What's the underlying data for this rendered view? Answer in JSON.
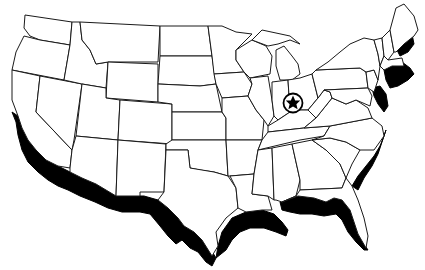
{
  "map": {
    "subject": "Outline map of the contiguous United States",
    "colors": {
      "background": "#ffffff",
      "outline": "#1a1a1a",
      "highlight": "#000000"
    },
    "highlighted_coastline": "Coastal regions shaded black along Pacific, Gulf and Atlantic coasts",
    "marker": {
      "icon": "star-in-circle-icon",
      "location": "Indiana / Kentucky / Ohio border region",
      "x": 293,
      "y": 103
    }
  }
}
